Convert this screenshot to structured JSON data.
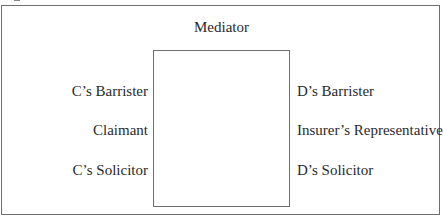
{
  "diagram": {
    "type": "mediation-seating-plan",
    "top": {
      "label": "Mediator"
    },
    "center": {
      "shape": "rectangle",
      "label": ""
    },
    "left_side": [
      {
        "label": "C’s Barrister"
      },
      {
        "label": "Claimant"
      },
      {
        "label": "C’s Solicitor"
      }
    ],
    "right_side": [
      {
        "label": "D’s Barrister"
      },
      {
        "label": "Insurer’s Representative"
      },
      {
        "label": "D’s Solicitor"
      }
    ],
    "colors": {
      "line": "#6f6f6f",
      "text": "#2a2a2a",
      "background": "#ffffff"
    }
  }
}
